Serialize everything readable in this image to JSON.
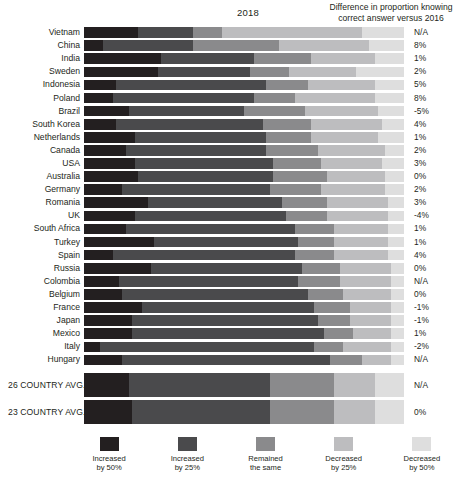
{
  "header": {
    "year_title": "2018",
    "difference_header_line1": "Difference in proportion knowing",
    "difference_header_line2": "correct answer versus 2016"
  },
  "legend": {
    "items": [
      {
        "label_line1": "Increased",
        "label_line2": "by 50%",
        "color": "#231f20"
      },
      {
        "label_line1": "Increased",
        "label_line2": "by 25%",
        "color": "#4a4a4c"
      },
      {
        "label_line1": "Remained",
        "label_line2": "the same",
        "color": "#8a8a8c"
      },
      {
        "label_line1": "Decreased",
        "label_line2": "by 25%",
        "color": "#bdbdbf"
      },
      {
        "label_line1": "Decreased",
        "label_line2": "by 50%",
        "color": "#dedede"
      }
    ]
  },
  "colors": {
    "increased_50": "#231f20",
    "increased_25": "#4a4a4c",
    "remained_same": "#8a8a8c",
    "decreased_25": "#bdbdbf",
    "decreased_50": "#dedede",
    "text": "#231f20",
    "background": "#ffffff"
  },
  "chart_data": {
    "type": "bar",
    "subtype": "stacked-horizontal-100-percent",
    "title": "2018",
    "xlabel": "",
    "ylabel": "",
    "xlim": [
      0,
      100
    ],
    "grid": false,
    "legend_position": "bottom",
    "series": [
      {
        "name": "Increased by 50%",
        "color": "#231f20"
      },
      {
        "name": "Increased by 25%",
        "color": "#4a4a4c"
      },
      {
        "name": "Remained the same",
        "color": "#8a8a8c"
      },
      {
        "name": "Decreased by 25%",
        "color": "#bdbdbf"
      },
      {
        "name": "Decreased by 50%",
        "color": "#dedede"
      }
    ],
    "categories": [
      "Vietnam",
      "China",
      "India",
      "Sweden",
      "Indonesia",
      "Poland",
      "Brazil",
      "South Korea",
      "Netherlands",
      "Canada",
      "USA",
      "Australia",
      "Germany",
      "Romania",
      "UK",
      "South Africa",
      "Turkey",
      "Spain",
      "Russia",
      "Colombia",
      "Belgium",
      "France",
      "Japan",
      "Mexico",
      "Italy",
      "Hungary"
    ],
    "rows": [
      {
        "country": "Vietnam",
        "values": [
          17,
          17,
          9,
          44,
          13
        ],
        "difference": "N/A"
      },
      {
        "country": "China",
        "values": [
          6,
          28,
          27,
          28,
          11
        ],
        "difference": "8%"
      },
      {
        "country": "India",
        "values": [
          24,
          29,
          18,
          20,
          9
        ],
        "difference": "1%"
      },
      {
        "country": "Sweden",
        "values": [
          23,
          29,
          12,
          21,
          15
        ],
        "difference": "2%"
      },
      {
        "country": "Indonesia",
        "values": [
          10,
          47,
          13,
          21,
          9
        ],
        "difference": "5%"
      },
      {
        "country": "Poland",
        "values": [
          9,
          44,
          13,
          25,
          9
        ],
        "difference": "8%"
      },
      {
        "country": "Brazil",
        "values": [
          14,
          36,
          19,
          23,
          8
        ],
        "difference": "-5%"
      },
      {
        "country": "South Korea",
        "values": [
          10,
          46,
          15,
          22,
          7
        ],
        "difference": "4%"
      },
      {
        "country": "Netherlands",
        "values": [
          16,
          41,
          14,
          21,
          8
        ],
        "difference": "1%"
      },
      {
        "country": "Canada",
        "values": [
          13,
          44,
          16,
          21,
          6
        ],
        "difference": "2%"
      },
      {
        "country": "USA",
        "values": [
          16,
          43,
          15,
          19,
          7
        ],
        "difference": "3%"
      },
      {
        "country": "Australia",
        "values": [
          17,
          42,
          17,
          18,
          6
        ],
        "difference": "0%"
      },
      {
        "country": "Germany",
        "values": [
          12,
          46,
          16,
          20,
          6
        ],
        "difference": "2%"
      },
      {
        "country": "Romania",
        "values": [
          20,
          42,
          14,
          19,
          5
        ],
        "difference": "3%"
      },
      {
        "country": "UK",
        "values": [
          16,
          47,
          13,
          19,
          5
        ],
        "difference": "-4%"
      },
      {
        "country": "South Africa",
        "values": [
          13,
          53,
          12,
          17,
          5
        ],
        "difference": "1%"
      },
      {
        "country": "Turkey",
        "values": [
          22,
          45,
          11,
          17,
          5
        ],
        "difference": "1%"
      },
      {
        "country": "Spain",
        "values": [
          9,
          57,
          12,
          17,
          5
        ],
        "difference": "4%"
      },
      {
        "country": "Russia",
        "values": [
          21,
          47,
          12,
          16,
          4
        ],
        "difference": "0%"
      },
      {
        "country": "Colombia",
        "values": [
          11,
          56,
          13,
          16,
          4
        ],
        "difference": "N/A"
      },
      {
        "country": "Belgium",
        "values": [
          12,
          58,
          11,
          15,
          4
        ],
        "difference": "0%"
      },
      {
        "country": "France",
        "values": [
          18,
          54,
          11,
          13,
          4
        ],
        "difference": "-1%"
      },
      {
        "country": "Japan",
        "values": [
          15,
          58,
          10,
          13,
          4
        ],
        "difference": "-1%"
      },
      {
        "country": "Mexico",
        "values": [
          15,
          60,
          9,
          12,
          4
        ],
        "difference": "1%"
      },
      {
        "country": "Italy",
        "values": [
          5,
          67,
          9,
          15,
          4
        ],
        "difference": "-2%"
      },
      {
        "country": "Hungary",
        "values": [
          12,
          65,
          10,
          9,
          4
        ],
        "difference": "N/A"
      }
    ],
    "averages": [
      {
        "label": "26 COUNTRY AVG.",
        "values": [
          14,
          44,
          20,
          13,
          9
        ],
        "difference": "N/A"
      },
      {
        "label": "23 COUNTRY AVG.",
        "values": [
          15,
          43,
          20,
          13,
          9
        ],
        "difference": "0%"
      }
    ]
  }
}
